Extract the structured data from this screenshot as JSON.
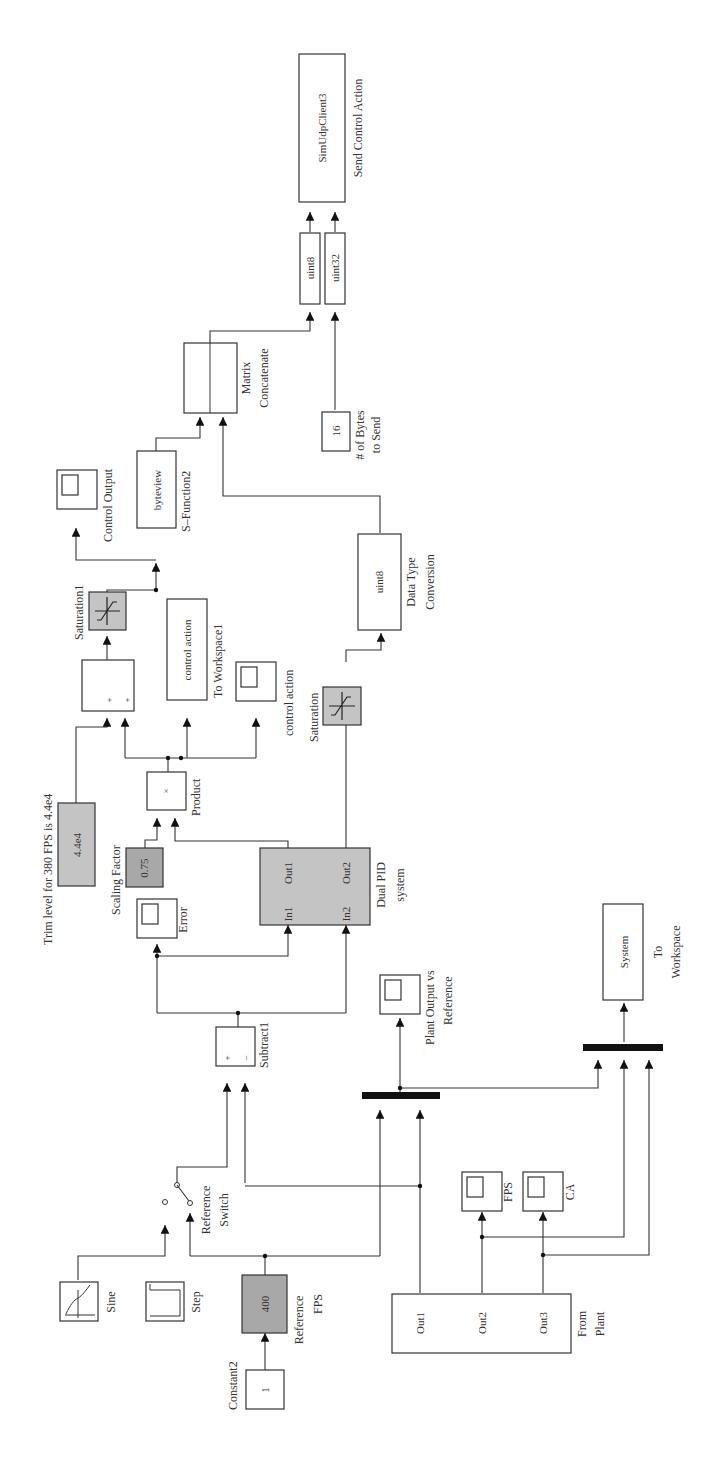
{
  "diagram": {
    "orientation": "rotated-90-ccw",
    "blocks": {
      "constant2": {
        "label": "Constant2",
        "value": "1"
      },
      "reference_fps": {
        "label_line1": "Reference",
        "label_line2": "FPS",
        "value": "400",
        "color": "#a8a8a8"
      },
      "sine": {
        "label": "Sine"
      },
      "step": {
        "label": "Step"
      },
      "reference_switch": {
        "label_line1": "Reference",
        "label_line2": "Switch"
      },
      "subtract1": {
        "label": "Subtract1",
        "sign_plus": "+",
        "sign_minus": "–"
      },
      "error_scope": {
        "label": "Error"
      },
      "dual_pid": {
        "label_line1": "Dual PID",
        "label_line2": "system",
        "in1": "In1",
        "in2": "In2",
        "out1": "Out1",
        "out2": "Out2",
        "color": "#c4c4c4"
      },
      "scaling_factor": {
        "label": "Scaling Factor",
        "value": "0.75",
        "color": "#a8a8a8"
      },
      "product": {
        "label": "Product",
        "symbol": "×"
      },
      "trim_level": {
        "label": "Trim level for 380 FPS is 4.4e4",
        "value": "4.4e4",
        "color": "#c4c4c4"
      },
      "sum": {
        "sign1": "+",
        "sign2": "+"
      },
      "to_workspace1": {
        "label": "To Workspace1",
        "value": "control action"
      },
      "control_action_scope": {
        "label": "control action"
      },
      "saturation1": {
        "label": "Saturation1"
      },
      "control_output_scope": {
        "label": "Control Output"
      },
      "s_function2": {
        "label": "S–Function2",
        "value": "byteview"
      },
      "saturation": {
        "label": "Saturation"
      },
      "data_type_conversion": {
        "label_line1": "Data Type",
        "label_line2": "Conversion",
        "value": "uint8"
      },
      "matrix_concatenate": {
        "label_line1": "Matrix",
        "label_line2": "Concatenate"
      },
      "bytes_to_send": {
        "label_line1": "# of Bytes",
        "label_line2": "to Send",
        "value": "16"
      },
      "cast_uint8": {
        "value": "uint8"
      },
      "cast_uint32": {
        "value": "uint32"
      },
      "sim_udp_client3": {
        "label": "Send Control Action",
        "value": "SimUdpClient3"
      },
      "plant_output_scope": {
        "label_line1": "Plant Output vs",
        "label_line2": "Reference"
      },
      "from_plant": {
        "label_line1": "From",
        "label_line2": "Plant",
        "out1": "Out1",
        "out2": "Out2",
        "out3": "Out3"
      },
      "fps_scope": {
        "label": "FPS"
      },
      "ca_scope": {
        "label": "CA"
      },
      "to_workspace": {
        "label_line1": "To",
        "label_line2": "Workspace",
        "value": "System"
      }
    }
  }
}
